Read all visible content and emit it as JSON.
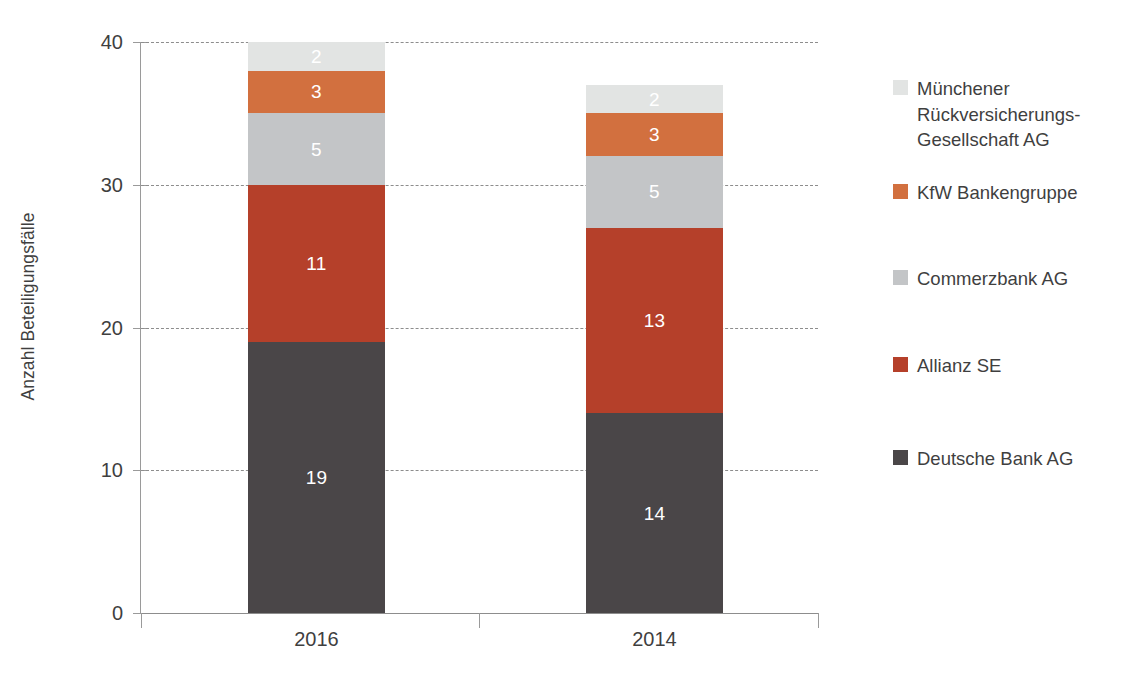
{
  "chart_data": {
    "type": "bar",
    "subtype": "stacked-bar",
    "title": "",
    "xlabel": "",
    "ylabel": "Anzahl Beteiligungsfälle",
    "categories": [
      "2016",
      "2014"
    ],
    "ylim": [
      0,
      40
    ],
    "yticks": [
      0,
      10,
      20,
      30,
      40
    ],
    "ytick_labels": [
      "0",
      "10",
      "20",
      "30",
      "40"
    ],
    "grid": true,
    "grid_style": "dashed horizontal",
    "legend_position": "right",
    "stack_order_bottom_to_top": [
      "Deutsche Bank AG",
      "Allianz SE",
      "Commerzbank AG",
      "KfW Bankengruppe",
      "Münchener Rückversicherungs-Gesellschaft AG"
    ],
    "series": [
      {
        "name": "Deutsche Bank AG",
        "color": "#4a4648",
        "values": [
          19,
          14
        ],
        "labels": [
          "19",
          "14"
        ]
      },
      {
        "name": "Allianz SE",
        "color": "#b5402a",
        "values": [
          11,
          13
        ],
        "labels": [
          "11",
          "13"
        ]
      },
      {
        "name": "Commerzbank AG",
        "color": "#c3c5c7",
        "values": [
          5,
          5
        ],
        "labels": [
          "5",
          "5"
        ]
      },
      {
        "name": "KfW Bankengruppe",
        "color": "#d2703f",
        "values": [
          3,
          3
        ],
        "labels": [
          "3",
          "3"
        ]
      },
      {
        "name": "Münchener Rückversicherungs-Gesellschaft AG",
        "color": "#e2e4e3",
        "values": [
          2,
          2
        ],
        "labels": [
          "2",
          "2"
        ]
      }
    ],
    "totals": [
      40,
      37
    ]
  },
  "axis": {
    "y_title": "Anzahl Beteiligungsfälle",
    "y_ticks": [
      "40",
      "30",
      "20",
      "10",
      "0"
    ],
    "x_ticks": [
      "2016",
      "2014"
    ]
  },
  "legend": {
    "items": [
      {
        "label": "Münchener Rückversicherungs-Gesellschaft AG",
        "color": "#e2e4e3"
      },
      {
        "label": "KfW Bankengruppe",
        "color": "#d2703f"
      },
      {
        "label": "Commerzbank AG",
        "color": "#c3c5c7"
      },
      {
        "label": "Allianz SE",
        "color": "#b5402a"
      },
      {
        "label": "Deutsche Bank AG",
        "color": "#4a4648"
      }
    ]
  }
}
